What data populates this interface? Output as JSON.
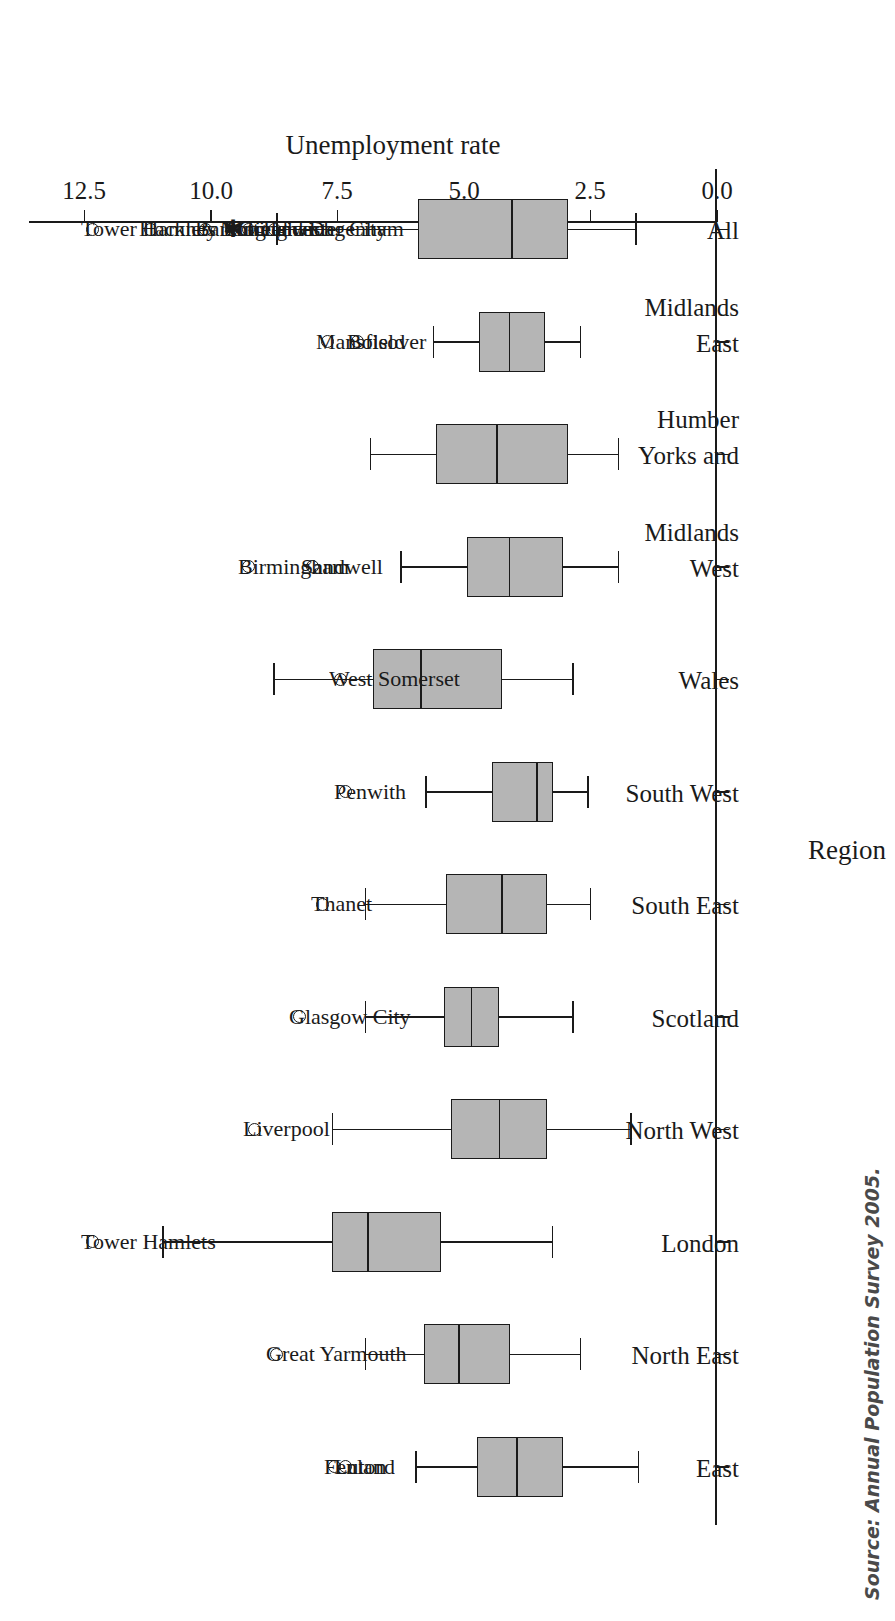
{
  "figure": {
    "orientation": "rotated-180",
    "source_note": "Source:  Annual Population Survey 2005."
  },
  "chart_data": {
    "type": "box",
    "title": "",
    "xlabel": "Region",
    "ylabel": "Unemployment rate",
    "ylim": [
      0.0,
      13.6
    ],
    "yticks": [
      "0.0",
      "2.5",
      "5.0",
      "7.5",
      "10.0",
      "12.5"
    ],
    "ytick_values": [
      0.0,
      2.5,
      5.0,
      7.5,
      10.0,
      12.5
    ],
    "grid": false,
    "legend": "none",
    "categories": [
      "East",
      "North East",
      "London",
      "North West",
      "Scotland",
      "South East",
      "South West",
      "Wales",
      "West Midlands",
      "Yorks and Humber",
      "East Midlands",
      "All"
    ],
    "category_label_lines": [
      [
        "East",
        ""
      ],
      [
        "North East",
        ""
      ],
      [
        "London",
        ""
      ],
      [
        "North West",
        ""
      ],
      [
        "Scotland",
        ""
      ],
      [
        "South East",
        ""
      ],
      [
        "South West",
        ""
      ],
      [
        "Wales",
        ""
      ],
      [
        "West",
        "Midlands"
      ],
      [
        "Yorks and",
        "Humber"
      ],
      [
        "East",
        "Midlands"
      ],
      [
        "All",
        ""
      ]
    ],
    "boxes": [
      {
        "category": "East",
        "whisker_low": 1.55,
        "q1": 3.05,
        "median": 3.95,
        "q3": 4.75,
        "whisker_high": 5.95,
        "outliers": [
          {
            "label": "Luton",
            "value": 7.35
          },
          {
            "label": "Fenland",
            "value": 7.55
          }
        ]
      },
      {
        "category": "North East",
        "whisker_low": 2.7,
        "q1": 4.1,
        "median": 5.1,
        "q3": 5.8,
        "whisker_high": 6.95,
        "outliers": [
          {
            "label": "Great Yarmouth",
            "value": 8.7
          }
        ]
      },
      {
        "category": "London",
        "whisker_low": 3.25,
        "q1": 5.45,
        "median": 6.9,
        "q3": 7.6,
        "whisker_high": 10.95,
        "outliers": [
          {
            "label": "Tower Hamlets",
            "value": 12.35
          }
        ]
      },
      {
        "category": "North West",
        "whisker_low": 1.7,
        "q1": 3.35,
        "median": 4.3,
        "q3": 5.25,
        "whisker_high": 7.6,
        "outliers": [
          {
            "label": "Liverpool",
            "value": 9.15
          }
        ]
      },
      {
        "category": "Scotland",
        "whisker_low": 2.85,
        "q1": 4.3,
        "median": 4.85,
        "q3": 5.4,
        "whisker_high": 6.95,
        "outliers": [
          {
            "label": "Glasgow City",
            "value": 8.25
          }
        ]
      },
      {
        "category": "South East",
        "whisker_low": 2.5,
        "q1": 3.35,
        "median": 4.25,
        "q3": 5.35,
        "whisker_high": 6.95,
        "outliers": [
          {
            "label": "Thanet",
            "value": 7.8
          }
        ]
      },
      {
        "category": "South West",
        "whisker_low": 2.55,
        "q1": 3.25,
        "median": 3.55,
        "q3": 4.45,
        "whisker_high": 5.75,
        "outliers": [
          {
            "label": "Penwith",
            "value": 7.35
          }
        ]
      },
      {
        "category": "Wales",
        "whisker_low": 2.85,
        "q1": 4.25,
        "median": 5.85,
        "q3": 6.8,
        "whisker_high": 8.75,
        "outliers": [
          {
            "label": "West Somerset",
            "value": 7.45
          }
        ]
      },
      {
        "category": "West Midlands",
        "whisker_low": 1.95,
        "q1": 3.05,
        "median": 4.1,
        "q3": 4.95,
        "whisker_high": 6.25,
        "outliers": [
          {
            "label": "Sandwell",
            "value": 8.0
          },
          {
            "label": "Birmingham",
            "value": 9.25
          }
        ]
      },
      {
        "category": "Yorks and Humber",
        "whisker_low": 1.95,
        "q1": 2.95,
        "median": 4.35,
        "q3": 5.55,
        "whisker_high": 6.85,
        "outliers": []
      },
      {
        "category": "East Midlands",
        "whisker_low": 2.7,
        "q1": 3.4,
        "median": 4.1,
        "q3": 4.7,
        "whisker_high": 5.6,
        "outliers": [
          {
            "label": "Bolsover",
            "value": 7.1
          },
          {
            "label": "Mansfield",
            "value": 7.7
          }
        ]
      },
      {
        "category": "All",
        "whisker_low": 1.6,
        "q1": 2.95,
        "median": 4.05,
        "q3": 5.9,
        "whisker_high": 8.7,
        "outliers": [
          {
            "label": "Leicester City",
            "value": 8.75
          },
          {
            "label": "Greenwich",
            "value": 9.25
          },
          {
            "label": "Enfield",
            "value": 9.55,
            "marker": "star"
          },
          {
            "label": "Nottingham",
            "value": 9.6
          },
          {
            "label": "Barking and Dagenham",
            "value": 10.1
          },
          {
            "label": "Hackney",
            "value": 11.2
          },
          {
            "label": "Tower Hamlets",
            "value": 12.35
          }
        ]
      }
    ]
  }
}
